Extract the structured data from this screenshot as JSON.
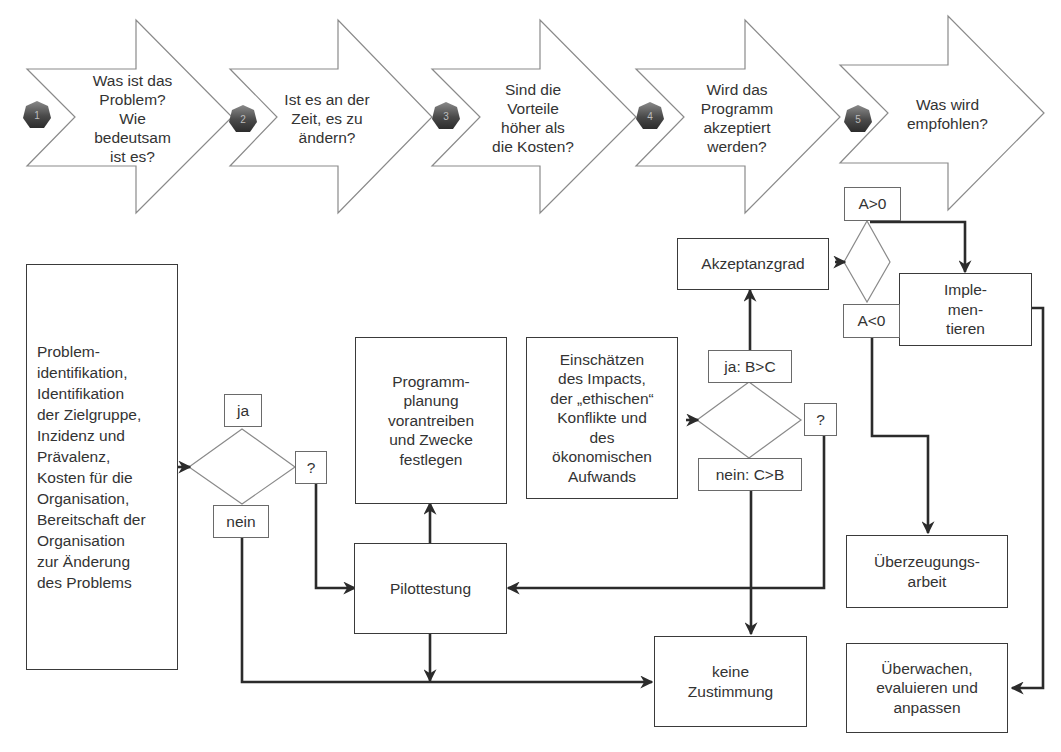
{
  "steps": [
    {
      "number": "1",
      "label": "Was ist das\nProblem?\nWie\nbedeutsam\nist es?"
    },
    {
      "number": "2",
      "label": "Ist es an der\nZeit, es zu\nändern?"
    },
    {
      "number": "3",
      "label": "Sind die\nVorteile\nhöher als\ndie Kosten?"
    },
    {
      "number": "4",
      "label": "Wird das\nProgramm\nakzeptiert\nwerden?"
    },
    {
      "number": "5",
      "label": "Was wird\nempfohlen?"
    }
  ],
  "boxes": {
    "problem": "Problem-\nidentifikation,\nIdentifikation\nder Zielgruppe,\nInzidenz und\nPrävalenz,\nKosten für die\nOrganisation,\nBereitschaft der\nOrganisation\nzur Änderung\ndes Problems",
    "programmplanung": "Programm-\nplanung\nvorantreiben\nund Zwecke\nfestlegen",
    "pilottestung": "Pilottestung",
    "keine_zustimmung": "keine\nZustimmung",
    "einschaetzen": "Einschätzen\ndes Impacts,\nder „ethischen“\nKonflikte und\ndes\nökonomischen\nAufwands",
    "akzeptanzgrad": "Akzeptanzgrad",
    "implementieren": "Imple-\nmen-\ntieren",
    "ueberzeugungsarbeit": "Überzeugungs-\narbeit",
    "ueberwachen": "Überwachen,\nevaluieren und\nanpassen"
  },
  "decision_labels": {
    "d1_yes": "ja",
    "d1_no": "nein",
    "d1_unknown": "?",
    "d2_yes": "ja: B>C",
    "d2_no": "nein: C>B",
    "d2_unknown": "?",
    "d3_positive": "A>0",
    "d3_negative": "A<0"
  },
  "colors": {
    "arrow_outline": "#8a8a8a",
    "connector": "#2b2b2b",
    "badge_dark": "#3c3c3c",
    "badge_light": "#7a7a7a"
  }
}
